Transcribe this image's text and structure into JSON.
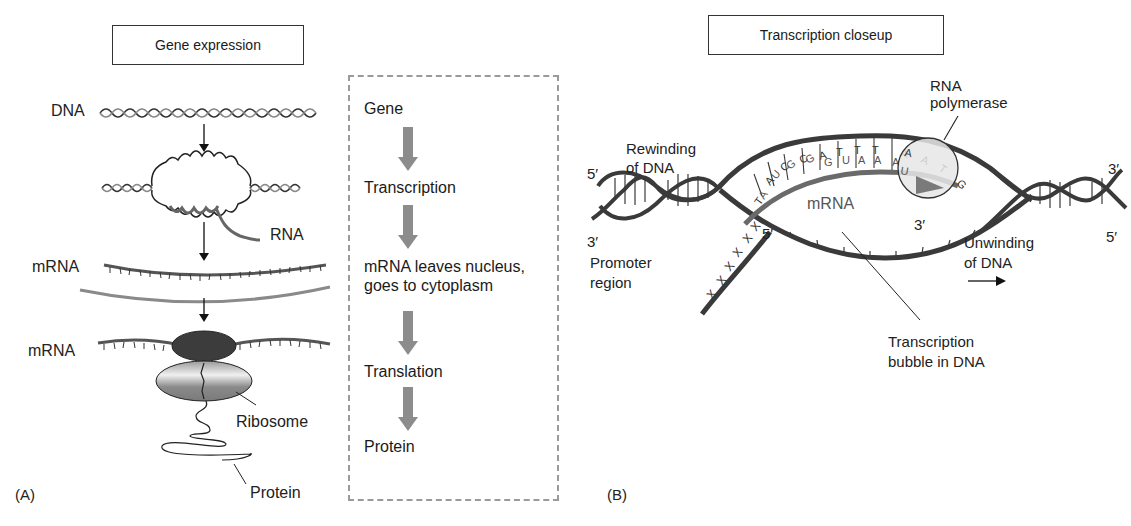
{
  "panel_a": {
    "letter": "(A)",
    "title": "Gene expression",
    "labels": {
      "dna": "DNA",
      "rna": "RNA",
      "mrna_top": "mRNA",
      "mrna_bottom": "mRNA",
      "ribosome": "Ribosome",
      "protein": "Protein"
    },
    "flow": {
      "steps": [
        "Gene",
        "Transcription",
        "mRNA leaves nucleus, goes to cytoplasm",
        "Translation",
        "Protein"
      ],
      "step_lines": {
        "s0": "Gene",
        "s1": "Transcription",
        "s2a": "mRNA leaves nucleus,",
        "s2b": "goes to cytoplasm",
        "s3": "Translation",
        "s4": "Protein"
      },
      "arrow_color": "#8c8c8c"
    }
  },
  "panel_b": {
    "letter": "(B)",
    "title": "Transcription closeup",
    "labels": {
      "rna_polymerase_1": "RNA",
      "rna_polymerase_2": "polymerase",
      "rewinding_1": "Rewinding",
      "rewinding_2": "of DNA",
      "five_prime_left": "5′",
      "three_prime_left": "3′",
      "promoter_1": "Promoter",
      "promoter_2": "region",
      "mrna": "mRNA",
      "five_prime_mrna": "5′",
      "three_prime_mrna": "3′",
      "three_prime_right": "3′",
      "five_prime_right": "5′",
      "unwinding_1": "Unwinding",
      "unwinding_2": "of DNA",
      "bubble_1": "Transcription",
      "bubble_2": "bubble in DNA"
    },
    "template_bases": [
      "T",
      "A",
      "C",
      "C",
      "A",
      "T",
      "T",
      "T",
      "A",
      "A",
      "T",
      "G"
    ],
    "mrna_bases": [
      "A",
      "U",
      "G",
      "G",
      "U",
      "A",
      "A",
      "A",
      "U"
    ],
    "colors": {
      "dna_strand": "#3a3a3a",
      "mrna_strand": "#6a6a6a",
      "polymerase_fill": "#e6e6e6",
      "polymerase_arrow": "#7a7a7a"
    }
  }
}
